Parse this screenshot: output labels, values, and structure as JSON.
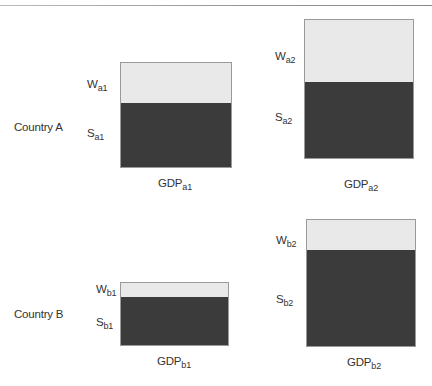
{
  "diagram": {
    "countries": [
      {
        "label": "Country A",
        "periods": [
          {
            "w_main": "W",
            "w_sub": "a1",
            "s_main": "S",
            "s_sub": "a1",
            "gdp_main": "GDP",
            "gdp_sub": "a1"
          },
          {
            "w_main": "W",
            "w_sub": "a2",
            "s_main": "S",
            "s_sub": "a2",
            "gdp_main": "GDP",
            "gdp_sub": "a2"
          }
        ]
      },
      {
        "label": "Country B",
        "periods": [
          {
            "w_main": "W",
            "w_sub": "b1",
            "s_main": "S",
            "s_sub": "b1",
            "gdp_main": "GDP",
            "gdp_sub": "b1"
          },
          {
            "w_main": "W",
            "w_sub": "b2",
            "s_main": "S",
            "s_sub": "b2",
            "gdp_main": "GDP",
            "gdp_sub": "b2"
          }
        ]
      }
    ],
    "colors": {
      "wages_fill": "#e9e9e9",
      "surplus_fill": "#3b3b3b",
      "border": "#9a9a9a"
    }
  }
}
